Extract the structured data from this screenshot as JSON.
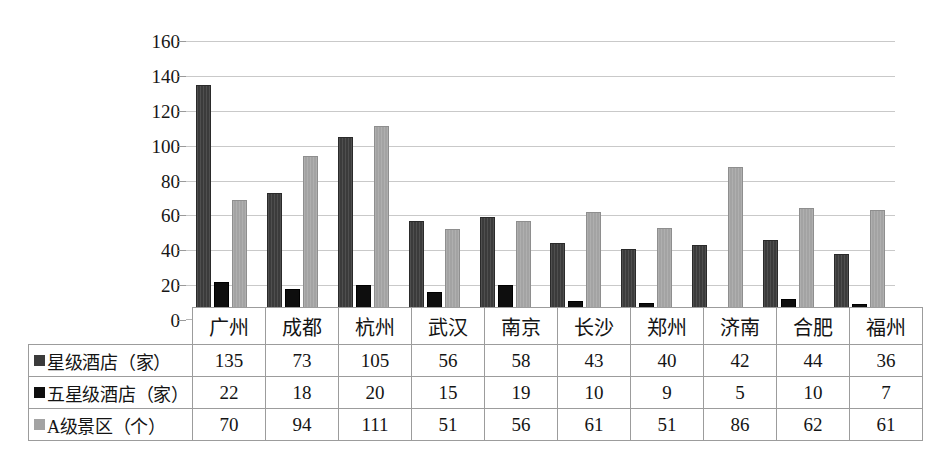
{
  "chart_data": {
    "type": "bar",
    "title": "",
    "xlabel": "",
    "ylabel": "",
    "ylim": [
      0,
      160
    ],
    "ytick_step": 20,
    "yticks": [
      0,
      20,
      40,
      60,
      80,
      100,
      120,
      140,
      160
    ],
    "grid": true,
    "legend_position": "table-row-headers",
    "categories": [
      "广州",
      "成都",
      "杭州",
      "武汉",
      "南京",
      "长沙",
      "郑州",
      "济南",
      "合肥",
      "福州"
    ],
    "series": [
      {
        "name": "星级酒店（家）",
        "color": "#3b3b3b",
        "values": [
          135,
          73,
          105,
          56,
          58,
          43,
          40,
          42,
          44,
          36
        ],
        "plotted": [
          135,
          73,
          105,
          57,
          59,
          44,
          41,
          43,
          46,
          38
        ]
      },
      {
        "name": "五星级酒店（家）",
        "color": "#0e0e0e",
        "values": [
          22,
          18,
          20,
          15,
          19,
          10,
          9,
          5,
          10,
          7
        ],
        "plotted": [
          22,
          18,
          20,
          16,
          20,
          11,
          10,
          6,
          12,
          9
        ]
      },
      {
        "name": "A级景区（个）",
        "color": "#a3a3a3",
        "values": [
          70,
          94,
          111,
          51,
          56,
          61,
          51,
          86,
          62,
          61
        ],
        "plotted": [
          69,
          94,
          111,
          52,
          57,
          62,
          53,
          88,
          64,
          63
        ]
      }
    ]
  },
  "table": {
    "corner_label": "",
    "column_headers": [
      "广州",
      "成都",
      "杭州",
      "武汉",
      "南京",
      "长沙",
      "郑州",
      "济南",
      "合肥",
      "福州"
    ],
    "rows": [
      {
        "label": "星级酒店（家）",
        "swatch_key": "k0",
        "swatch_color": "#3b3b3b",
        "values": [
          "135",
          "73",
          "105",
          "56",
          "58",
          "43",
          "40",
          "42",
          "44",
          "36"
        ]
      },
      {
        "label": "五星级酒店（家）",
        "swatch_key": "k1",
        "swatch_color": "#0e0e0e",
        "values": [
          "22",
          "18",
          "20",
          "15",
          "19",
          "10",
          "9",
          "5",
          "10",
          "7"
        ]
      },
      {
        "label": "A级景区（个）",
        "swatch_key": "k2",
        "swatch_color": "#a3a3a3",
        "values": [
          "70",
          "94",
          "111",
          "51",
          "56",
          "61",
          "51",
          "86",
          "62",
          "61"
        ]
      }
    ]
  },
  "axis": {
    "ytick_labels": [
      "160",
      "140",
      "120",
      "100",
      "80",
      "60",
      "40",
      "20",
      "0"
    ]
  },
  "colors": {
    "series_1": "#3b3b3b",
    "series_2": "#0e0e0e",
    "series_3": "#a3a3a3",
    "gridline": "#c9c9c9",
    "table_border": "#9c9c9c",
    "background": "#ffffff"
  }
}
